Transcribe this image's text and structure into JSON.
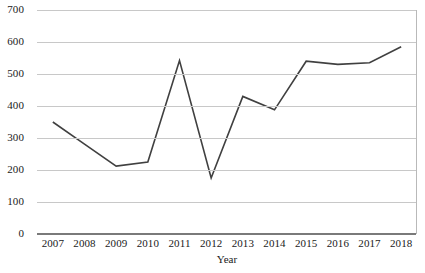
{
  "chart_data": {
    "type": "line",
    "title": "",
    "xlabel": "Year",
    "ylabel": "",
    "categories": [
      "2007",
      "2008",
      "2009",
      "2010",
      "2011",
      "2012",
      "2013",
      "2014",
      "2015",
      "2016",
      "2017",
      "2018"
    ],
    "values": [
      350,
      281,
      212,
      225,
      542,
      175,
      430,
      388,
      540,
      530,
      535,
      585
    ],
    "series": [
      {
        "name": "",
        "values": [
          350,
          281,
          212,
          225,
          542,
          175,
          430,
          388,
          540,
          530,
          535,
          585
        ]
      }
    ],
    "ylim": [
      0,
      700
    ],
    "yticks": [
      0,
      100,
      200,
      300,
      400,
      500,
      600,
      700
    ],
    "ytick_labels": [
      "0",
      "100",
      "200",
      "300",
      "400",
      "500",
      "600",
      "700"
    ],
    "grid": true,
    "legend": "none",
    "line_color": "#404040",
    "grid_color": "#c8c8c8",
    "axis_color": "#7a7a7a",
    "background_color": "#ffffff"
  }
}
